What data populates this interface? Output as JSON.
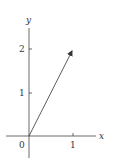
{
  "diagram": {
    "type": "vector-plot",
    "axes": {
      "x_label": "x",
      "y_label": "y",
      "origin_label": "0",
      "x_ticks": [
        "1"
      ],
      "y_ticks": [
        "1",
        "2"
      ]
    },
    "vector": {
      "from": [
        0,
        0
      ],
      "to": [
        1,
        2
      ]
    },
    "colors": {
      "stroke": "#333333",
      "background": "#ffffff"
    }
  }
}
